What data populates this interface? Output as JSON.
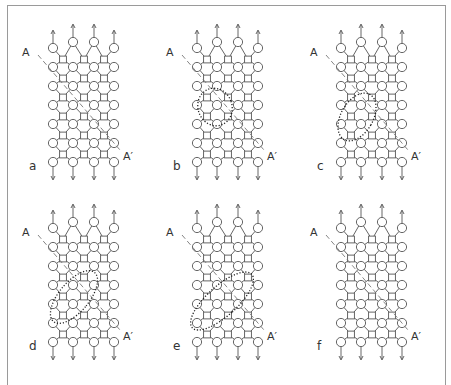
{
  "figure": {
    "panels": [
      {
        "id": "a",
        "label": "a",
        "ox": 0,
        "oy": 0,
        "loop": null
      },
      {
        "id": "b",
        "label": "b",
        "ox": 144,
        "oy": 0,
        "loop": {
          "cx": 71,
          "cy": 107,
          "rx": 17,
          "ry": 19,
          "rot": -20
        }
      },
      {
        "id": "c",
        "label": "c",
        "ox": 288,
        "oy": 0,
        "loop": {
          "cx": 69,
          "cy": 117,
          "rx": 16,
          "ry": 26,
          "rot": 30
        }
      },
      {
        "id": "d",
        "label": "d",
        "ox": 0,
        "oy": 180,
        "loop": {
          "cx": 74,
          "cy": 117,
          "rx": 15,
          "ry": 32,
          "rot": 40
        }
      },
      {
        "id": "e",
        "label": "e",
        "ox": 144,
        "oy": 180,
        "loop": {
          "cx": 78,
          "cy": 121,
          "rx": 15,
          "ry": 40,
          "rot": 48
        }
      },
      {
        "id": "f",
        "label": "f",
        "ox": 288,
        "oy": 180,
        "loop": null
      }
    ],
    "slip_line_start_label": "A",
    "slip_line_end_label": "A′",
    "colors": {
      "line": "#555555",
      "frame": "#9a9a9a",
      "text": "#333333"
    }
  }
}
